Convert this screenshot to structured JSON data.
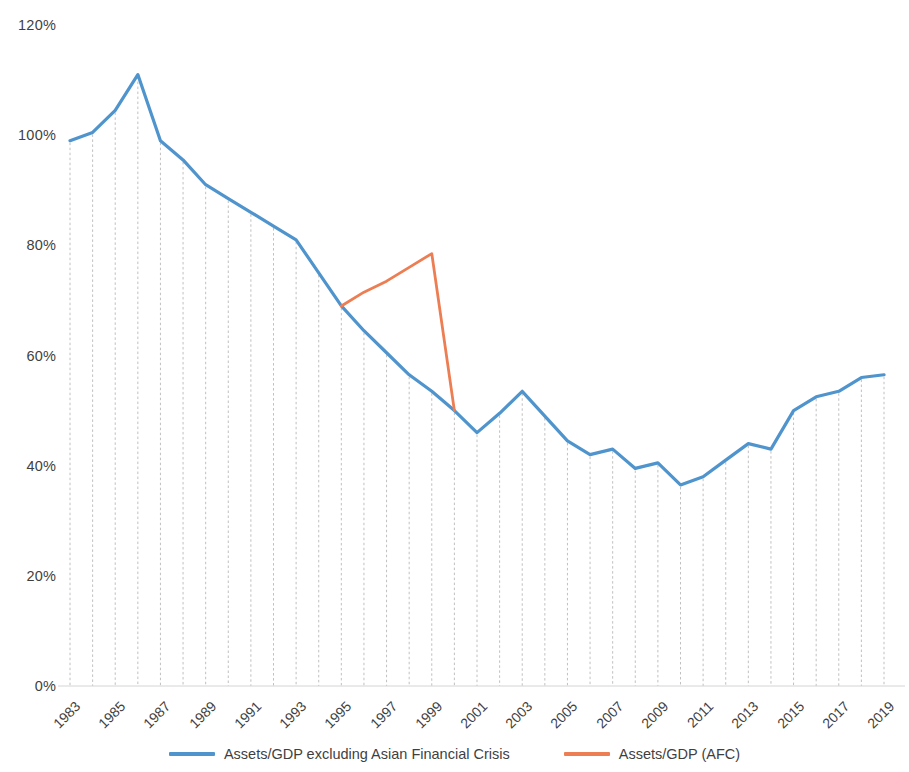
{
  "chart_data": {
    "type": "line",
    "title": "",
    "subtitle": "",
    "xlabel": "",
    "ylabel": "",
    "ylim": [
      0,
      120
    ],
    "y_ticks": [
      0,
      20,
      40,
      60,
      80,
      100,
      120
    ],
    "y_tick_labels": [
      "0%",
      "20%",
      "40%",
      "60%",
      "80%",
      "100%",
      "120%"
    ],
    "x_tick_labels": [
      "1983",
      "1985",
      "1987",
      "1989",
      "1991",
      "1993",
      "1995",
      "1997",
      "1999",
      "2001",
      "2003",
      "2005",
      "2007",
      "2009",
      "2011",
      "2013",
      "2015",
      "2017",
      "2019"
    ],
    "x_tick_years": [
      1983,
      1985,
      1987,
      1989,
      1991,
      1993,
      1995,
      1997,
      1999,
      2001,
      2003,
      2005,
      2007,
      2009,
      2011,
      2013,
      2015,
      2017,
      2019
    ],
    "x_tick_rotation": -45,
    "xlim": [
      1983,
      2019
    ],
    "grid": "vertical drop-lines from data points to x-axis (dashed grey)",
    "legend_position": "bottom-center",
    "series": [
      {
        "name": "Assets/GDP excluding Asian Financial Crisis",
        "color": "#4F94CD",
        "x": [
          1983,
          1984,
          1985,
          1986,
          1987,
          1988,
          1989,
          1990,
          1991,
          1992,
          1993,
          1994,
          1995,
          1996,
          1997,
          1998,
          1999,
          2000,
          2001,
          2002,
          2003,
          2004,
          2005,
          2006,
          2007,
          2008,
          2009,
          2010,
          2011,
          2012,
          2013,
          2014,
          2015,
          2016,
          2017,
          2018,
          2019
        ],
        "values": [
          99.0,
          100.5,
          104.5,
          111.0,
          99.0,
          95.5,
          91.0,
          88.5,
          86.0,
          83.5,
          81.0,
          75.0,
          69.0,
          64.5,
          60.5,
          56.5,
          53.5,
          50.0,
          46.0,
          49.5,
          53.5,
          49.0,
          44.5,
          42.0,
          43.0,
          39.5,
          40.5,
          36.5,
          38.0,
          41.0,
          44.0,
          43.0,
          50.0,
          52.5,
          53.5,
          56.0,
          56.5
        ]
      },
      {
        "name": "Assets/GDP (AFC)",
        "color": "#ED7D52",
        "x": [
          1995,
          1996,
          1997,
          1998,
          1999,
          2000
        ],
        "values": [
          69.0,
          71.5,
          73.5,
          76.0,
          78.5,
          50.0
        ]
      }
    ]
  },
  "legend": {
    "items": [
      {
        "label": "Assets/GDP excluding Asian Financial Crisis",
        "color": "#4F94CD"
      },
      {
        "label": "Assets/GDP (AFC)",
        "color": "#ED7D52"
      }
    ]
  }
}
